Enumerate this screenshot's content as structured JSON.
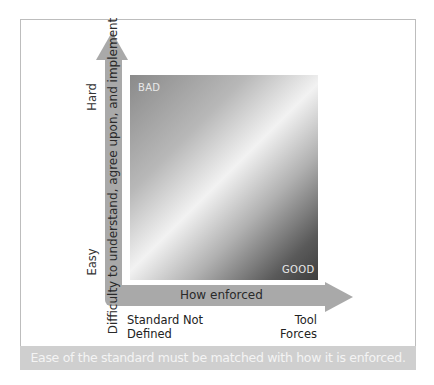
{
  "diagram": {
    "type": "2x2-gradient-quadrant",
    "y_axis": {
      "label": "Difficulty to understand, agree upon, and implement",
      "high": "Hard",
      "low": "Easy"
    },
    "x_axis": {
      "label": "How enforced",
      "low": "Standard Not Defined",
      "high": "Tool Forces"
    },
    "corners": {
      "top_left": "BAD",
      "bottom_right": "GOOD"
    },
    "caption": "Ease of the standard must be matched with how it is enforced.",
    "colors": {
      "arrow": "#a9a9a9",
      "caption_bg": "#cfcfcf",
      "caption_text": "#f4f4f4",
      "gradient_light": "#f2f2f2",
      "gradient_dark": "#3e3e3e"
    }
  }
}
